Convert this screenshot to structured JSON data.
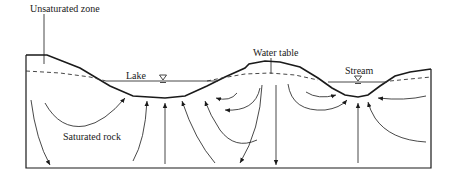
{
  "diagram": {
    "type": "groundwater-flow cross-section",
    "labels": {
      "unsaturated_zone": "Unsaturated zone",
      "lake": "Lake",
      "water_table": "Water table",
      "stream": "Stream",
      "saturated_rock": "Saturated rock"
    },
    "symbols": {
      "lake_water_level": "water-level-triangle",
      "stream_water_level": "water-level-triangle"
    },
    "colors": {
      "line": "#1a1a1a",
      "background": "#ffffff"
    }
  }
}
